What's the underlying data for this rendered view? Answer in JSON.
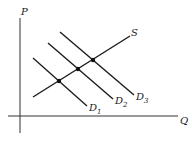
{
  "diagram": {
    "title": "",
    "axes": {
      "y_label": "P",
      "x_label": "Q"
    },
    "supply": {
      "label": "S"
    },
    "demand": [
      {
        "label": "D",
        "sub": "1"
      },
      {
        "label": "D",
        "sub": "2"
      },
      {
        "label": "D",
        "sub": "3"
      }
    ],
    "equilibria_count": 3,
    "colors": {
      "line": "#1a1a1a",
      "background": "#ffffff"
    }
  }
}
